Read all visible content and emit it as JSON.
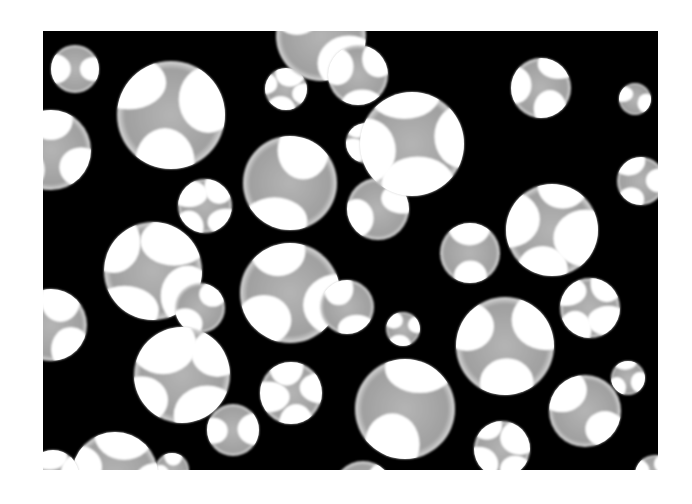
{
  "image": {
    "description": "Grayscale micrograph of porous foam: black matrix with circular pores showing gray interiors and white window highlights",
    "colors": {
      "matrix": "#000000",
      "pore": "#a8a8a8",
      "highlight": "#ffffff",
      "background": "#ffffff"
    },
    "frame": {
      "x": 43,
      "y": 31,
      "width": 615,
      "height": 439
    },
    "pores": [
      {
        "cx": 32,
        "cy": 38,
        "r": 24
      },
      {
        "cx": 128,
        "cy": 84,
        "r": 54
      },
      {
        "cx": 243,
        "cy": 58,
        "r": 21
      },
      {
        "cx": 247,
        "cy": 152,
        "r": 47
      },
      {
        "cx": 8,
        "cy": 119,
        "r": 40
      },
      {
        "cx": 162,
        "cy": 175,
        "r": 27
      },
      {
        "cx": 278,
        "cy": 5,
        "r": 45
      },
      {
        "cx": 315,
        "cy": 44,
        "r": 30
      },
      {
        "cx": 323,
        "cy": 112,
        "r": 20
      },
      {
        "cx": 335,
        "cy": 178,
        "r": 31
      },
      {
        "cx": 247,
        "cy": 262,
        "r": 50
      },
      {
        "cx": 369,
        "cy": 113,
        "r": 52
      },
      {
        "cx": 427,
        "cy": 222,
        "r": 30
      },
      {
        "cx": 498,
        "cy": 57,
        "r": 30
      },
      {
        "cx": 509,
        "cy": 199,
        "r": 46
      },
      {
        "cx": 592,
        "cy": 68,
        "r": 16
      },
      {
        "cx": 598,
        "cy": 150,
        "r": 24
      },
      {
        "cx": 110,
        "cy": 240,
        "r": 49
      },
      {
        "cx": 157,
        "cy": 277,
        "r": 25
      },
      {
        "cx": 8,
        "cy": 294,
        "r": 36
      },
      {
        "cx": 139,
        "cy": 344,
        "r": 48
      },
      {
        "cx": 304,
        "cy": 276,
        "r": 27
      },
      {
        "cx": 360,
        "cy": 298,
        "r": 17
      },
      {
        "cx": 248,
        "cy": 362,
        "r": 31
      },
      {
        "cx": 190,
        "cy": 399,
        "r": 26
      },
      {
        "cx": 129,
        "cy": 439,
        "r": 17
      },
      {
        "cx": 72,
        "cy": 444,
        "r": 43
      },
      {
        "cx": 362,
        "cy": 378,
        "r": 50
      },
      {
        "cx": 462,
        "cy": 315,
        "r": 49
      },
      {
        "cx": 547,
        "cy": 277,
        "r": 30
      },
      {
        "cx": 542,
        "cy": 380,
        "r": 36
      },
      {
        "cx": 585,
        "cy": 347,
        "r": 17
      },
      {
        "cx": 459,
        "cy": 418,
        "r": 28
      },
      {
        "cx": 320,
        "cy": 460,
        "r": 30
      },
      {
        "cx": 612,
        "cy": 444,
        "r": 20
      },
      {
        "cx": 10,
        "cy": 445,
        "r": 26
      }
    ]
  }
}
